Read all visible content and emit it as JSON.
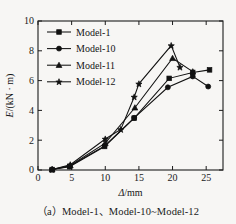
{
  "figure": {
    "caption": "（a）Model-1、Model-10~Model-12",
    "background_color": "#f7f6f4",
    "line_color": "#111111"
  },
  "chart_data": {
    "type": "line",
    "title": "",
    "xlabel": "Δ/mm",
    "ylabel": "E/(kN · m)",
    "xlim": [
      0,
      27.5
    ],
    "ylim": [
      0,
      10
    ],
    "xticks": [
      0,
      5,
      10,
      15,
      20,
      25
    ],
    "yticks": [
      0,
      2,
      4,
      6,
      8,
      10
    ],
    "xticklabels": [
      "0",
      "5",
      "10",
      "15",
      "20",
      "25"
    ],
    "yticklabels": [
      "0",
      "2",
      "4",
      "6",
      "8",
      "10"
    ],
    "grid": false,
    "legend_position": "upper left",
    "series": [
      {
        "name": "Model-1",
        "marker": "square",
        "points": [
          {
            "x": 2.1,
            "y": 0.03
          },
          {
            "x": 4.7,
            "y": 0.22
          },
          {
            "x": 9.9,
            "y": 1.58
          },
          {
            "x": 14.3,
            "y": 3.48
          },
          {
            "x": 19.5,
            "y": 6.15
          },
          {
            "x": 23.0,
            "y": 6.55
          },
          {
            "x": 25.5,
            "y": 6.72
          }
        ]
      },
      {
        "name": "Model-10",
        "marker": "circle",
        "points": [
          {
            "x": 2.1,
            "y": 0.03
          },
          {
            "x": 4.7,
            "y": 0.25
          },
          {
            "x": 9.9,
            "y": 1.62
          },
          {
            "x": 14.3,
            "y": 3.5
          },
          {
            "x": 19.3,
            "y": 5.55
          },
          {
            "x": 23.0,
            "y": 6.28
          },
          {
            "x": 25.3,
            "y": 5.6
          }
        ]
      },
      {
        "name": "Model-11",
        "marker": "triangle",
        "points": [
          {
            "x": 2.1,
            "y": 0.03
          },
          {
            "x": 4.8,
            "y": 0.3
          },
          {
            "x": 10.0,
            "y": 1.8
          },
          {
            "x": 14.4,
            "y": 4.18
          },
          {
            "x": 20.0,
            "y": 7.5
          },
          {
            "x": 23.0,
            "y": 6.6
          }
        ]
      },
      {
        "name": "Model-12",
        "marker": "star",
        "points": [
          {
            "x": 2.1,
            "y": 0.03
          },
          {
            "x": 4.8,
            "y": 0.35
          },
          {
            "x": 10.0,
            "y": 2.08
          },
          {
            "x": 12.3,
            "y": 2.72
          },
          {
            "x": 14.3,
            "y": 4.9
          },
          {
            "x": 15.0,
            "y": 5.78
          },
          {
            "x": 19.8,
            "y": 8.35
          },
          {
            "x": 21.1,
            "y": 6.9
          }
        ]
      }
    ]
  }
}
